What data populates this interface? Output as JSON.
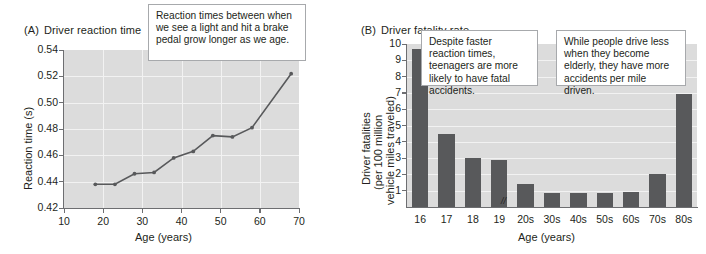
{
  "figure": {
    "width": 706,
    "height": 254,
    "background": "#ffffff",
    "plot_bg": "#dcdcdc",
    "ink": "#231f20",
    "axis_color": "#6d6e71",
    "bar_color": "#58595b",
    "line_color": "#58595b",
    "callout_border": "#a7a9ac"
  },
  "panel_a": {
    "tag": "(A)",
    "title": "Driver reaction time",
    "callout": "Reaction times between when we see a light and hit a brake pedal grow longer as we age.",
    "ylabel": "Reaction time (s)",
    "xlabel": "Age (years)",
    "yticks": [
      "0.42",
      "0.44",
      "0.46",
      "0.48",
      "0.50",
      "0.52",
      "0.54"
    ],
    "xticks": [
      "10",
      "20",
      "30",
      "40",
      "50",
      "60",
      "70"
    ]
  },
  "panel_b": {
    "tag": "(B)",
    "title": "Driver fatality rate",
    "callout_left": "Despite faster reaction times, teenagers are more likely to have fatal accidents.",
    "callout_right": "While people drive less when they become elderly, they have more accidents per mile driven.",
    "ylabel_line1": "Driver fatalities",
    "ylabel_line2": "(per 100 million",
    "ylabel_line3": "vehicle miles traveled)",
    "xlabel": "Age (years)",
    "yticks": [
      "1",
      "2",
      "3",
      "4",
      "5",
      "6",
      "7",
      "8",
      "9",
      "10"
    ],
    "axis_break_symbol": "//"
  },
  "chart_data": [
    {
      "type": "line",
      "panel": "A",
      "title": "Driver reaction time",
      "xlabel": "Age (years)",
      "ylabel": "Reaction time (s)",
      "xlim": [
        10,
        70
      ],
      "ylim": [
        0.42,
        0.54
      ],
      "grid": true,
      "legend": "none",
      "x": [
        18,
        23,
        28,
        33,
        38,
        43,
        48,
        53,
        58,
        68
      ],
      "y": [
        0.438,
        0.438,
        0.446,
        0.447,
        0.458,
        0.463,
        0.475,
        0.474,
        0.481,
        0.522
      ],
      "annotations": [
        "Reaction times between when we see a light and hit a brake pedal grow longer as we age."
      ]
    },
    {
      "type": "bar",
      "panel": "B",
      "title": "Driver fatality rate",
      "xlabel": "Age (years)",
      "ylabel": "Driver fatalities (per 100 million vehicle miles traveled)",
      "ylim": [
        0,
        10
      ],
      "grid": true,
      "legend": "none",
      "categories": [
        "16",
        "17",
        "18",
        "19",
        "20s",
        "30s",
        "40s",
        "50s",
        "60s",
        "70s",
        "80s"
      ],
      "values": [
        9.7,
        4.5,
        3.0,
        2.9,
        1.4,
        0.85,
        0.85,
        0.85,
        0.95,
        2.05,
        6.95
      ],
      "annotations": [
        "Despite faster reaction times, teenagers are more likely to have fatal accidents.",
        "While people drive less when they become elderly, they have more accidents per mile driven."
      ]
    }
  ]
}
